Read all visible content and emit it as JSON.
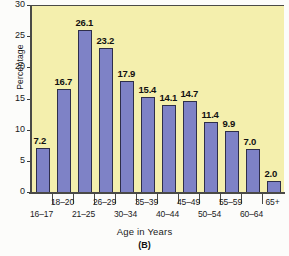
{
  "chart_data": {
    "type": "bar",
    "title": "",
    "xlabel": "Age in Years",
    "ylabel": "Percentage",
    "categories": [
      "16–17",
      "18–20",
      "21–25",
      "26–29",
      "30–34",
      "35–39",
      "40–44",
      "45–49",
      "50–54",
      "55–59",
      "60–64",
      "65+"
    ],
    "values": [
      7.2,
      16.7,
      26.1,
      23.2,
      17.9,
      15.4,
      14.1,
      14.7,
      11.4,
      9.9,
      7.0,
      2.0
    ],
    "value_labels": [
      "7.2",
      "16.7",
      "26.1",
      "23.2",
      "17.9",
      "15.4",
      "14.1",
      "14.7",
      "11.4",
      "9.9",
      "7.0",
      "2.0"
    ],
    "ylim": [
      0,
      30
    ],
    "y_ticks": [
      0,
      5,
      10,
      15,
      20,
      25,
      30
    ],
    "y_tick_labels": [
      "0",
      "5",
      "10",
      "15",
      "20",
      "25",
      "30"
    ],
    "grid": false,
    "legend": null,
    "caption": "(B)",
    "colors": {
      "bar_fill": "#7e82c6",
      "bar_stroke": "#2e2e4a",
      "plot_background": "#f4efad",
      "axis": "#4a4a46",
      "text": "#1a1a1a",
      "page_background": "#fcfcfa"
    }
  }
}
